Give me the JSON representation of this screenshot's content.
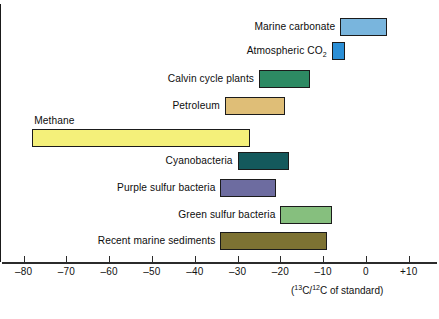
{
  "chart_data": {
    "type": "bar",
    "orientation": "horizontal-range",
    "title": "",
    "subtitle": "",
    "xlabel": "(13C/12C of standard)",
    "ylabel": "",
    "xlim": [
      -85,
      14
    ],
    "grid": false,
    "legend": "none",
    "zero_reference_line": 0,
    "xticks": [
      -80,
      -70,
      -60,
      -50,
      -40,
      -30,
      -20,
      -10,
      0,
      10
    ],
    "xtick_labels": [
      "–80",
      "–70",
      "–60",
      "–50",
      "–40",
      "–30",
      "–20",
      "–10",
      "0",
      "+10"
    ],
    "categories": [
      "Marine carbonate",
      "Atmospheric CO2",
      "Calvin cycle plants",
      "Petroleum",
      "Methane",
      "Cyanobacteria",
      "Purple sulfur bacteria",
      "Green sulfur bacteria",
      "Recent marine sediments"
    ],
    "ranges": [
      [
        -6,
        5
      ],
      [
        -8,
        -5
      ],
      [
        -25,
        -13
      ],
      [
        -33,
        -19
      ],
      [
        -78,
        -27
      ],
      [
        -30,
        -18
      ],
      [
        -34,
        -21
      ],
      [
        -20,
        -8
      ],
      [
        -34,
        -9
      ]
    ],
    "colors": [
      "#79b5dd",
      "#2b8fd6",
      "#2d8a63",
      "#dfbe77",
      "#f4f07a",
      "#14595c",
      "#6d6ca0",
      "#86bf7e",
      "#7d7233"
    ]
  },
  "axis": {
    "caption_open": "(",
    "caption_sup1": "13",
    "caption_mid1": "C/",
    "caption_sup2": "12",
    "caption_end": "C of standard)",
    "ticks": [
      {
        "value": -80,
        "label": "–80"
      },
      {
        "value": -70,
        "label": "–70"
      },
      {
        "value": -60,
        "label": "–60"
      },
      {
        "value": -50,
        "label": "–50"
      },
      {
        "value": -40,
        "label": "–40"
      },
      {
        "value": -30,
        "label": "–30"
      },
      {
        "value": -20,
        "label": "–20"
      },
      {
        "value": -10,
        "label": "–10"
      },
      {
        "value": 0,
        "label": "0"
      },
      {
        "value": 10,
        "label": "+10"
      }
    ]
  },
  "bars": [
    {
      "name": "marine-carbonate",
      "label": "Marine carbonate",
      "label_sub": "",
      "min": -6,
      "max": 5,
      "color": "#79b5dd",
      "label_position": "left",
      "row_top": 18
    },
    {
      "name": "atmospheric-co2",
      "label": "Atmospheric CO",
      "label_sub": "2",
      "min": -8,
      "max": -5,
      "color": "#2b8fd6",
      "label_position": "left",
      "row_top": 42
    },
    {
      "name": "calvin-cycle-plants",
      "label": "Calvin cycle plants",
      "label_sub": "",
      "min": -25,
      "max": -13,
      "color": "#2d8a63",
      "label_position": "left",
      "row_top": 70
    },
    {
      "name": "petroleum",
      "label": "Petroleum",
      "label_sub": "",
      "min": -33,
      "max": -19,
      "color": "#dfbe77",
      "label_position": "left",
      "row_top": 97
    },
    {
      "name": "methane",
      "label": "Methane",
      "label_sub": "",
      "min": -78,
      "max": -27,
      "color": "#f4f07a",
      "label_position": "above",
      "row_top": 129
    },
    {
      "name": "cyanobacteria",
      "label": "Cyanobacteria",
      "label_sub": "",
      "min": -30,
      "max": -18,
      "color": "#14595c",
      "label_position": "left",
      "row_top": 152
    },
    {
      "name": "purple-sulfur-bacteria",
      "label": "Purple sulfur bacteria",
      "label_sub": "",
      "min": -34,
      "max": -21,
      "color": "#6d6ca0",
      "label_position": "left",
      "row_top": 179
    },
    {
      "name": "green-sulfur-bacteria",
      "label": "Green sulfur bacteria",
      "label_sub": "",
      "min": -20,
      "max": -8,
      "color": "#86bf7e",
      "label_position": "left",
      "row_top": 206
    },
    {
      "name": "recent-marine-sediments",
      "label": "Recent marine sediments",
      "label_sub": "",
      "min": -34,
      "max": -9,
      "color": "#7d7233",
      "label_position": "left",
      "row_top": 232
    }
  ],
  "geometry": {
    "zero_x": 366,
    "px_per_unit": 4.28
  }
}
